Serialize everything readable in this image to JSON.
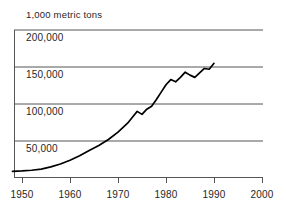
{
  "chart_data": {
    "type": "line",
    "title": "1,000 metric tons",
    "subtitle": "",
    "xlabel": "",
    "ylabel": "1,000 metric tons",
    "xlim": [
      1948,
      2000
    ],
    "ylim": [
      0,
      225000
    ],
    "grid": true,
    "legend": null,
    "xticks": [
      1950,
      1960,
      1970,
      1980,
      1990,
      2000
    ],
    "xtick_labels": [
      "1950",
      "1960",
      "1970",
      "1980",
      "1990",
      "2000"
    ],
    "yticks": [
      50000,
      100000,
      150000,
      200000
    ],
    "ytick_labels": [
      "50,000",
      "100,000",
      "150,000",
      "200,000"
    ],
    "series": [
      {
        "name": "production",
        "x": [
          1948,
          1950,
          1952,
          1954,
          1956,
          1958,
          1960,
          1962,
          1964,
          1966,
          1968,
          1970,
          1971,
          1972,
          1973,
          1974,
          1975,
          1976,
          1977,
          1978,
          1979,
          1980,
          1981,
          1982,
          1983,
          1984,
          1985,
          1986,
          1987,
          1988,
          1989,
          1990
        ],
        "y": [
          9000,
          9500,
          10500,
          12000,
          15000,
          19000,
          24000,
          30000,
          37000,
          44000,
          52000,
          62000,
          68000,
          74000,
          82000,
          90000,
          86000,
          93000,
          97000,
          106000,
          116000,
          126000,
          133000,
          130000,
          136000,
          143000,
          139000,
          136000,
          142000,
          148000,
          147000,
          155000
        ]
      }
    ]
  },
  "ytick_positions": {
    "200,000": 30,
    "150,000": 67,
    "100,000": 104,
    "50,000": 141
  },
  "xtick_positions": {
    "1950": 22,
    "1960": 70,
    "1970": 118,
    "1980": 166,
    "1990": 214,
    "2000": 262
  },
  "colors": {
    "line": "#000000",
    "grid": "#555555",
    "axis": "#555555",
    "text": "#262626",
    "background": "#ffffff"
  }
}
